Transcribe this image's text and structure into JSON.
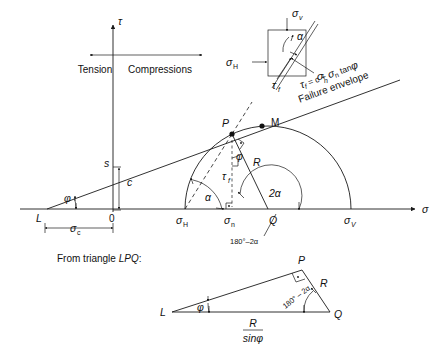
{
  "figure": {
    "axes": {
      "tau_label": "τ",
      "sigma_label": "σ",
      "tension_label": "Tension",
      "compression_label": "Compressions"
    },
    "envelope": {
      "equation": "τf = c + σn tanφ",
      "equation_parts": {
        "tau": "τ",
        "tau_sub": "f",
        "eq": " = c + ",
        "sigma": "σ",
        "sigma_sub": "n",
        "tan": " tan",
        "phi": "φ"
      },
      "caption": "Failure envelope",
      "intercept_point_label": "s",
      "cohesion_label": "c",
      "friction_angle_label": "φ"
    },
    "points": {
      "L": "L",
      "O": "0",
      "P": "P",
      "M": "M",
      "Q": "Q"
    },
    "stress_labels": {
      "sigma_c": "σ",
      "sigma_c_sub": "c",
      "sigma_H": "σ",
      "sigma_H_sub": "H",
      "sigma_n": "σ",
      "sigma_n_sub": "n",
      "sigma_V": "σ",
      "sigma_V_sub": "V",
      "sigma_v_elem": "σ",
      "sigma_v_elem_sub": "v",
      "tau_f": "τ",
      "tau_f_sub": "f",
      "radius": "R"
    },
    "angles": {
      "alpha": "α",
      "two_alpha": "2α",
      "phi": "φ",
      "supplement": "180°–2α",
      "supplement_tri": "180° – 2α"
    },
    "triangle_note": {
      "prefix": "From triangle ",
      "name": "LPQ",
      "suffix": ":",
      "full": "From triangle LPQ:",
      "base_numerator": "R",
      "base_denominator": "sinφ",
      "side_R": "R",
      "angle_phi": "φ",
      "vertex_L": "L",
      "vertex_P": "P",
      "vertex_Q": "Q"
    },
    "colors": {
      "ink": "#1a1a1a",
      "background": "#ffffff"
    }
  }
}
